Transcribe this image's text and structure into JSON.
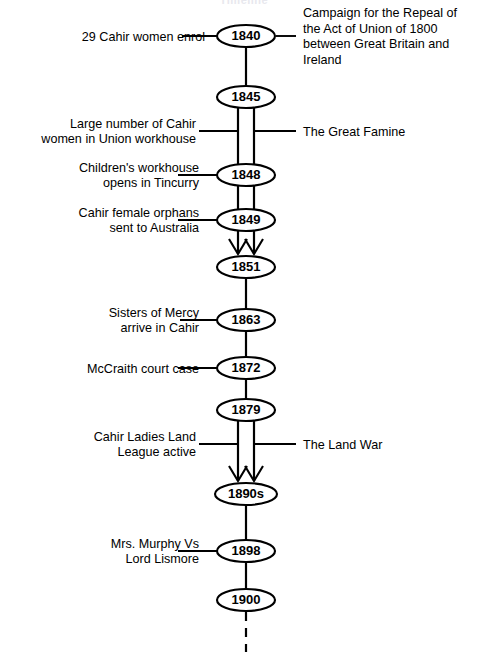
{
  "page": {
    "title": "Timeline",
    "width": 488,
    "height": 659,
    "background": "#ffffff",
    "ink_color": "#000000",
    "title_color": "#e8e8ee"
  },
  "diagram": {
    "type": "vertical-timeline",
    "axis_x": 246,
    "axis_top": 36,
    "axis_bottom": 600,
    "node_rx": 29,
    "node_ry": 11,
    "double_line_offset": 8,
    "dashed_tail": {
      "from_y": 612,
      "to_y": 652
    },
    "nodes": [
      {
        "id": "n1840",
        "label": "1840",
        "y": 36,
        "rx": 29,
        "ry": 11
      },
      {
        "id": "n1845",
        "label": "1845",
        "y": 97,
        "rx": 29,
        "ry": 11
      },
      {
        "id": "n1848",
        "label": "1848",
        "y": 175,
        "rx": 29,
        "ry": 11
      },
      {
        "id": "n1849",
        "label": "1849",
        "y": 220,
        "rx": 29,
        "ry": 11
      },
      {
        "id": "n1851",
        "label": "1851",
        "y": 267,
        "rx": 29,
        "ry": 11
      },
      {
        "id": "n1863",
        "label": "1863",
        "y": 320,
        "rx": 29,
        "ry": 11
      },
      {
        "id": "n1872",
        "label": "1872",
        "y": 368,
        "rx": 29,
        "ry": 11
      },
      {
        "id": "n1879",
        "label": "1879",
        "y": 410,
        "rx": 29,
        "ry": 11
      },
      {
        "id": "n1890s",
        "label": "1890s",
        "y": 494,
        "rx": 31,
        "ry": 11
      },
      {
        "id": "n1898",
        "label": "1898",
        "y": 551,
        "rx": 29,
        "ry": 11
      },
      {
        "id": "n1900",
        "label": "1900",
        "y": 600,
        "rx": 29,
        "ry": 11
      }
    ],
    "segments": [
      {
        "from": "n1840",
        "to": "n1845",
        "style": "single"
      },
      {
        "from": "n1845",
        "to": "n1848",
        "style": "double"
      },
      {
        "from": "n1848",
        "to": "n1849",
        "style": "double"
      },
      {
        "from": "n1849",
        "to": "n1851",
        "style": "double-arrow"
      },
      {
        "from": "n1851",
        "to": "n1863",
        "style": "single"
      },
      {
        "from": "n1863",
        "to": "n1872",
        "style": "single"
      },
      {
        "from": "n1872",
        "to": "n1879",
        "style": "single"
      },
      {
        "from": "n1879",
        "to": "n1890s",
        "style": "double-arrow"
      },
      {
        "from": "n1890s",
        "to": "n1898",
        "style": "single"
      },
      {
        "from": "n1898",
        "to": "n1900",
        "style": "single"
      }
    ],
    "annotations": [
      {
        "id": "a-1840-left",
        "side": "left",
        "attach_y": 36,
        "text_x": 205,
        "leader": {
          "x1": 182,
          "x2": 217
        },
        "lines": [
          "29 Cahir women enrol"
        ],
        "align": "end"
      },
      {
        "id": "a-1840-right",
        "side": "right",
        "attach_y": 36,
        "text_x": 303,
        "leader": {
          "x1": 276,
          "x2": 296
        },
        "lines": [
          "Campaign for the Repeal  of",
          "the Act of Union of 1800",
          "between Great Britain and",
          "Ireland"
        ],
        "align": "start"
      },
      {
        "id": "a-famine-left",
        "side": "left",
        "attach_y": 131,
        "text_x": 196,
        "leader": {
          "x1": 199,
          "x2": 238
        },
        "lines": [
          "Large number of Cahir",
          "women in Union workhouse"
        ],
        "align": "end"
      },
      {
        "id": "a-famine-right",
        "side": "right",
        "attach_y": 131,
        "text_x": 303,
        "leader": {
          "x1": 254,
          "x2": 296
        },
        "lines": [
          "The Great Famine"
        ],
        "align": "start"
      },
      {
        "id": "a-1848-left",
        "side": "left",
        "attach_y": 175,
        "text_x": 199,
        "leader": {
          "x1": 178,
          "x2": 217
        },
        "lines": [
          "Children's workhouse",
          "opens in Tincurry"
        ],
        "align": "end"
      },
      {
        "id": "a-1849-left",
        "side": "left",
        "attach_y": 220,
        "text_x": 199,
        "leader": {
          "x1": 178,
          "x2": 217
        },
        "lines": [
          "Cahir female orphans",
          "sent to Australia"
        ],
        "align": "end"
      },
      {
        "id": "a-1863-left",
        "side": "left",
        "attach_y": 320,
        "text_x": 199,
        "leader": {
          "x1": 180,
          "x2": 217
        },
        "lines": [
          "Sisters of Mercy",
          "arrive in Cahir"
        ],
        "align": "end"
      },
      {
        "id": "a-1872-left",
        "side": "left",
        "attach_y": 368,
        "text_x": 199,
        "leader": {
          "x1": 178,
          "x2": 217
        },
        "lines": [
          "McCraith court case"
        ],
        "align": "end"
      },
      {
        "id": "a-landwar-left",
        "side": "left",
        "attach_y": 444,
        "text_x": 196,
        "leader": {
          "x1": 199,
          "x2": 238
        },
        "lines": [
          "Cahir Ladies Land",
          "League active"
        ],
        "align": "end"
      },
      {
        "id": "a-landwar-right",
        "side": "right",
        "attach_y": 444,
        "text_x": 303,
        "leader": {
          "x1": 254,
          "x2": 296
        },
        "lines": [
          "The Land War"
        ],
        "align": "start"
      },
      {
        "id": "a-1898-left",
        "side": "left",
        "attach_y": 551,
        "text_x": 199,
        "leader": {
          "x1": 178,
          "x2": 217
        },
        "lines": [
          "Mrs. Murphy Vs",
          "Lord Lismore"
        ],
        "align": "end"
      }
    ]
  }
}
